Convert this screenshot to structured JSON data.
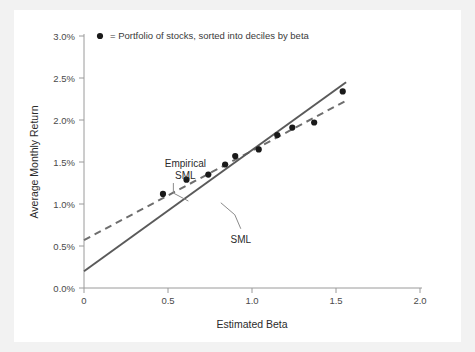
{
  "chart_data": {
    "type": "scatter",
    "title": "",
    "xlabel": "Estimated Beta",
    "ylabel": "Average Monthly Return",
    "xlim": [
      0,
      2.0
    ],
    "ylim": [
      0,
      3.0
    ],
    "xticks": [
      0,
      0.5,
      1.0,
      1.5,
      2.0
    ],
    "xtick_labels": [
      "0",
      "0.5",
      "1.0",
      "1.5",
      "2.0"
    ],
    "yticks": [
      0,
      0.5,
      1.0,
      1.5,
      2.0,
      2.5,
      3.0
    ],
    "ytick_labels": [
      "0.0%",
      "0.5%",
      "1.0%",
      "1.5%",
      "2.0%",
      "2.5%",
      "3.0%"
    ],
    "grid": false,
    "legend_position": "top-left-inside",
    "legend": [
      {
        "marker": "filled-circle",
        "text": "= Portfolio of stocks, sorted into deciles by beta"
      }
    ],
    "series": [
      {
        "name": "Portfolio of stocks, sorted into deciles by beta",
        "type": "scatter",
        "marker": "filled-circle",
        "color": "#1a1a1a",
        "points": [
          {
            "x": 0.47,
            "y": 1.12
          },
          {
            "x": 0.61,
            "y": 1.29
          },
          {
            "x": 0.74,
            "y": 1.35
          },
          {
            "x": 0.84,
            "y": 1.47
          },
          {
            "x": 0.9,
            "y": 1.57
          },
          {
            "x": 1.04,
            "y": 1.65
          },
          {
            "x": 1.15,
            "y": 1.82
          },
          {
            "x": 1.24,
            "y": 1.91
          },
          {
            "x": 1.37,
            "y": 1.97
          },
          {
            "x": 1.54,
            "y": 2.34
          }
        ]
      },
      {
        "name": "Empirical SML",
        "type": "line",
        "style": "dashed",
        "color": "#6e6e6e",
        "x_start": 0.0,
        "y_start": 0.57,
        "x_end": 1.56,
        "y_end": 2.23
      },
      {
        "name": "SML",
        "type": "line",
        "style": "solid",
        "color": "#5a5a5a",
        "x_start": 0.0,
        "y_start": 0.2,
        "x_end": 1.56,
        "y_end": 2.45
      }
    ],
    "annotations": [
      {
        "name": "empirical-sml",
        "lines": [
          "Empirical",
          "SML"
        ],
        "x": 0.52,
        "y": 1.44
      },
      {
        "name": "sml",
        "lines": [
          "SML"
        ],
        "x": 0.85,
        "y": 0.61
      }
    ]
  },
  "colors": {
    "page_background": "#f2f2f2",
    "panel_background": "#ffffff",
    "axis": "#9a9a9a",
    "tick_text": "#4a4a4a",
    "marker": "#1a1a1a",
    "sml_line": "#5a5a5a",
    "empirical_line": "#6e6e6e",
    "leader_line": "#8a8a8a"
  }
}
